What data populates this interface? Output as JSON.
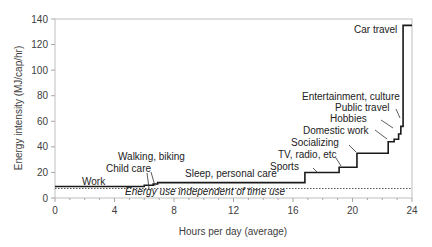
{
  "chart_data": {
    "type": "line",
    "subtype": "step",
    "title": "",
    "xlabel": "Hours per day (average)",
    "ylabel": "Energy intensity (MJ/cap/hr)",
    "xlim": [
      0,
      24
    ],
    "ylim": [
      0,
      140
    ],
    "xticks": [
      "0",
      "4",
      "8",
      "12",
      "16",
      "20",
      "24"
    ],
    "yticks": [
      "0",
      "20",
      "40",
      "60",
      "80",
      "100",
      "120",
      "140"
    ],
    "grid": false,
    "legend": null,
    "baseline": {
      "label": "Energy use independent of time use",
      "value": 9,
      "style": "dotted"
    },
    "segments": [
      {
        "activity": "Work",
        "x_start": 0.0,
        "x_end": 6.0,
        "y": 9
      },
      {
        "activity": "Child care",
        "x_start": 6.0,
        "x_end": 6.6,
        "y": 10
      },
      {
        "activity": "Walking, biking",
        "x_start": 6.6,
        "x_end": 6.9,
        "y": 11
      },
      {
        "activity": "Sleep, personal care",
        "x_start": 6.9,
        "x_end": 16.8,
        "y": 12
      },
      {
        "activity": "Sports",
        "x_start": 16.8,
        "x_end": 19.1,
        "y": 20
      },
      {
        "activity": "TV, radio, etc",
        "x_start": 19.1,
        "x_end": 20.3,
        "y": 24
      },
      {
        "activity": "Socializing",
        "x_start": 20.3,
        "x_end": 22.4,
        "y": 35
      },
      {
        "activity": "Domestic work",
        "x_start": 22.4,
        "x_end": 22.8,
        "y": 44
      },
      {
        "activity": "Hobbies",
        "x_start": 22.8,
        "x_end": 23.1,
        "y": 46
      },
      {
        "activity": "Public travel",
        "x_start": 23.1,
        "x_end": 23.25,
        "y": 50
      },
      {
        "activity": "Entertainment, culture",
        "x_start": 23.25,
        "x_end": 23.4,
        "y": 56
      },
      {
        "activity": "Car travel",
        "x_start": 23.4,
        "x_end": 24.0,
        "y": 135
      }
    ],
    "colors": {
      "line": "#1a1a1a",
      "axis": "#a6a6a6",
      "baseline": "#555555"
    }
  }
}
